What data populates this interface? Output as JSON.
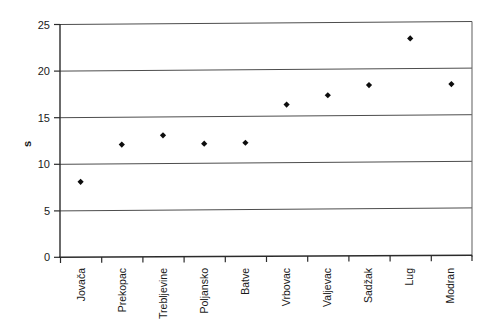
{
  "chart_data": {
    "type": "scatter",
    "title": "",
    "xlabel": "",
    "ylabel": "s",
    "categories": [
      "Jovača",
      "Prekopac",
      "Trebljevine",
      "Poljansko",
      "Batve",
      "Vrbovac",
      "Valjevac",
      "Sadžak",
      "Lug",
      "Modran"
    ],
    "values": [
      8.1,
      12.1,
      13.1,
      12.2,
      12.3,
      16.4,
      17.4,
      18.5,
      23.5,
      18.6
    ],
    "ylim": [
      0,
      25
    ],
    "yticks": [
      0,
      5,
      10,
      15,
      20,
      25
    ],
    "ytick_labels": [
      "0",
      "5",
      "10",
      "15",
      "20",
      "25"
    ],
    "grid": true,
    "grid_axis": "y",
    "legend": false,
    "legend_position": "none",
    "marker": "diamond",
    "marker_color": "#0d0d0d",
    "series": [
      {
        "name": "s",
        "values": [
          8.1,
          12.1,
          13.1,
          12.2,
          12.3,
          16.4,
          17.4,
          18.5,
          23.5,
          18.6
        ]
      }
    ]
  },
  "axes": {
    "y_axis_title": "s",
    "y_tick_0": "0",
    "y_tick_1": "5",
    "y_tick_2": "10",
    "y_tick_3": "15",
    "y_tick_4": "20",
    "y_tick_5": "25"
  },
  "x_labels": {
    "l0": "Jovača",
    "l1": "Prekopac",
    "l2": "Trebljevine",
    "l3": "Poljansko",
    "l4": "Batve",
    "l5": "Vrbovac",
    "l6": "Valjevac",
    "l7": "Sadžak",
    "l8": "Lug",
    "l9": "Modran"
  },
  "colors": {
    "marker": "#0d0d0d",
    "grid": "#4d4d4d",
    "frame": "#6b6b6b",
    "axis": "#2b2b2b",
    "background": "#ffffff"
  }
}
